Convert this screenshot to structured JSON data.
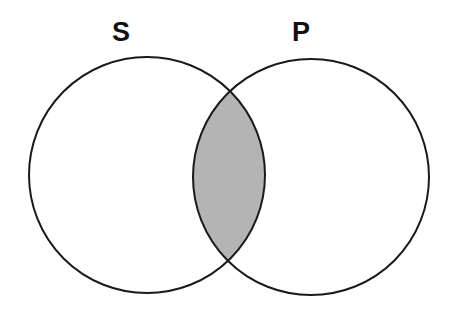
{
  "diagram": {
    "type": "venn",
    "sets": [
      {
        "label": "S",
        "cx": 147,
        "cy": 175,
        "r": 118
      },
      {
        "label": "P",
        "cx": 311,
        "cy": 177,
        "r": 118
      }
    ],
    "shaded_region": "S ∩ P",
    "shade_color": "#b4b4b4",
    "stroke_color": "#1a1a1a"
  }
}
